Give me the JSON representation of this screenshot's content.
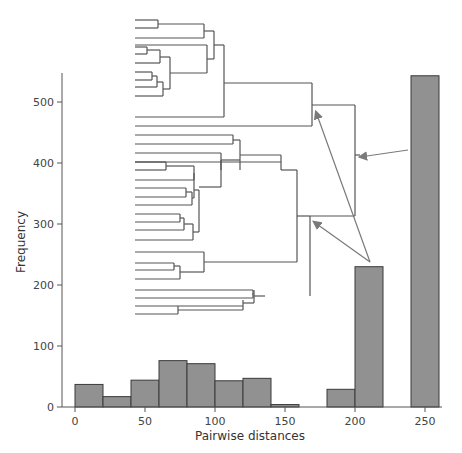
{
  "chart_data": {
    "type": "bar",
    "title": "",
    "xlabel": "Pairwise distances",
    "ylabel": "Frequency",
    "xlim": [
      -10,
      270
    ],
    "ylim": [
      0,
      550
    ],
    "xticks": [
      0,
      50,
      100,
      150,
      200,
      250
    ],
    "yticks": [
      0,
      100,
      200,
      300,
      400,
      500
    ],
    "bin_width": 20,
    "bins": [
      {
        "start": 0,
        "end": 20,
        "value": 37
      },
      {
        "start": 20,
        "end": 40,
        "value": 17
      },
      {
        "start": 40,
        "end": 60,
        "value": 44
      },
      {
        "start": 60,
        "end": 80,
        "value": 76
      },
      {
        "start": 80,
        "end": 100,
        "value": 71
      },
      {
        "start": 100,
        "end": 120,
        "value": 43
      },
      {
        "start": 120,
        "end": 140,
        "value": 47
      },
      {
        "start": 140,
        "end": 160,
        "value": 4
      },
      {
        "start": 180,
        "end": 200,
        "value": 29
      },
      {
        "start": 200,
        "end": 220,
        "value": 230
      },
      {
        "start": 240,
        "end": 260,
        "value": 543
      }
    ],
    "grid": false,
    "legend": null,
    "inset": {
      "type": "dendrogram",
      "description": "Hierarchical clustering tree inset; arrows point from histogram bars at ~210 and ~250 to the corresponding upper-level merge nodes of the tree."
    }
  },
  "colors": {
    "bar_fill": "#919191",
    "bar_stroke": "#3a3a3a",
    "axis": "#555555",
    "tree": "#555555",
    "arrow": "#7a7a7a"
  }
}
